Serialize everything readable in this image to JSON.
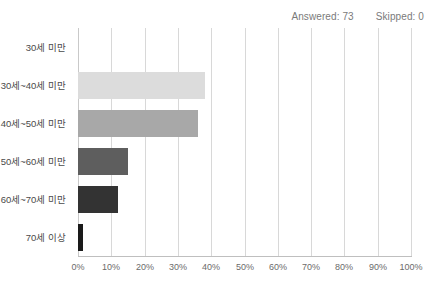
{
  "summary": {
    "answered_label": "Answered: 73",
    "skipped_label": "Skipped: 0"
  },
  "chart_data": {
    "type": "bar",
    "orientation": "horizontal",
    "title": "",
    "subtitle": "",
    "xlabel": "",
    "ylabel": "",
    "categories": [
      "30세 미만",
      "30세~40세 미만",
      "40세~50세 미만",
      "50세~60세 미만",
      "60세~70세 미만",
      "70세 이상"
    ],
    "values": [
      0,
      38.1,
      36.0,
      15.0,
      12.0,
      1.4
    ],
    "value_suffix": "%",
    "xlim": [
      0,
      100
    ],
    "tick_labels": [
      "0%",
      "10%",
      "20%",
      "30%",
      "40%",
      "50%",
      "60%",
      "70%",
      "80%",
      "90%",
      "100%"
    ],
    "tick_values": [
      0,
      10,
      20,
      30,
      40,
      50,
      60,
      70,
      80,
      90,
      100
    ],
    "grid": true,
    "legend": false,
    "bar_colors": [
      "#ffffff",
      "#dcdcdc",
      "#a8a8a8",
      "#5e5e5e",
      "#333333",
      "#1a1a1a"
    ],
    "gridline_color": "#d8d8d8",
    "axis_color": "#bfbfbf",
    "background": "#ffffff"
  }
}
